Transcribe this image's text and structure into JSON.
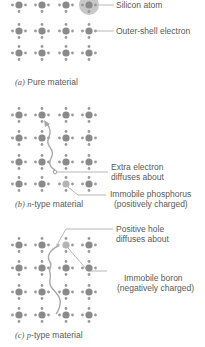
{
  "colors": {
    "atom": "#8a8a8a",
    "electron": "#9a9a9a",
    "leader": "#999999",
    "highlight": "#c8c8c8",
    "dopant": "#b4b4b4",
    "path": "#a8a8a8",
    "text": "#5a5a5a"
  },
  "grid": {
    "columns_x": [
      19,
      42,
      66,
      89
    ],
    "atom_radius": 3.6,
    "electron_radius": 1.4,
    "electron_offset": 6.5
  },
  "panels": [
    {
      "id": "a",
      "caption_letter": "(a)",
      "caption_text": "Pure material",
      "rows_y": [
        5,
        31,
        53
      ],
      "highlight_atom": {
        "x": 89,
        "y": 5,
        "r": 10
      },
      "labels": [
        {
          "text": "Silicon atom",
          "x": 116,
          "y": 1,
          "leader": [
            99,
            5,
            114,
            5
          ]
        },
        {
          "text": "Outer-shell electron",
          "x": 116,
          "y": 27,
          "leader": [
            97,
            31,
            114,
            31
          ]
        }
      ]
    },
    {
      "id": "b",
      "caption_letter": "(b)",
      "caption_italic": "n",
      "caption_text": "-type material",
      "rows_y": [
        115,
        138,
        162,
        184
      ],
      "dopant_atom": {
        "x": 66,
        "y": 184
      },
      "free_electron": {
        "x": 55,
        "y": 172
      },
      "labels": [
        {
          "text": "Extra electron",
          "x": 112,
          "y": 163
        },
        {
          "text": "diffuses about",
          "x": 112,
          "y": 173
        },
        {
          "text": "Immobile phosphorus",
          "x": 110,
          "y": 189
        },
        {
          "text": "(positively charged)",
          "x": 114,
          "y": 199
        }
      ]
    },
    {
      "id": "c",
      "caption_letter": "(c)",
      "caption_italic": "p",
      "caption_text": "-type material",
      "rows_y": [
        245,
        268,
        292,
        315
      ],
      "dopant_atom": {
        "x": 66,
        "y": 245
      },
      "hole": {
        "x": 58,
        "y": 245
      },
      "labels": [
        {
          "text": "Positive hole",
          "x": 116,
          "y": 225
        },
        {
          "text": "diffuses about",
          "x": 116,
          "y": 235
        },
        {
          "text": "Immobile boron",
          "x": 125,
          "y": 275
        },
        {
          "text": "(negatively charged)",
          "x": 117,
          "y": 285
        }
      ]
    }
  ],
  "text": {
    "a_caption_letter": "(a)",
    "a_caption": "Pure material",
    "a_label_1": "Silicon atom",
    "a_label_2": "Outer-shell electron",
    "b_caption_letter": "(b)",
    "b_caption_italic": "n",
    "b_caption": "-type material",
    "b_label_1": "Extra electron",
    "b_label_2": "diffuses about",
    "b_label_3": "Immobile phosphorus",
    "b_label_4": "(positively charged)",
    "c_caption_letter": "(c)",
    "c_caption_italic": "p",
    "c_caption": "-type material",
    "c_label_1": "Positive hole",
    "c_label_2": "diffuses about",
    "c_label_3": "Immobile boron",
    "c_label_4": "(negatively charged)"
  }
}
